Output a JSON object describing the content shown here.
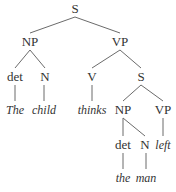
{
  "diagram": {
    "type": "syntax-tree",
    "nodes": [
      {
        "id": "s1",
        "label": "S",
        "kind": "category"
      },
      {
        "id": "np1",
        "label": "NP",
        "kind": "category"
      },
      {
        "id": "vp1",
        "label": "VP",
        "kind": "category"
      },
      {
        "id": "det1",
        "label": "det",
        "kind": "category"
      },
      {
        "id": "n1",
        "label": "N",
        "kind": "category"
      },
      {
        "id": "v1",
        "label": "V",
        "kind": "category"
      },
      {
        "id": "s2",
        "label": "S",
        "kind": "category"
      },
      {
        "id": "w_the1",
        "label": "The",
        "kind": "word"
      },
      {
        "id": "w_child",
        "label": "child",
        "kind": "word"
      },
      {
        "id": "w_thinks",
        "label": "thinks",
        "kind": "word"
      },
      {
        "id": "np2",
        "label": "NP",
        "kind": "category"
      },
      {
        "id": "vp2",
        "label": "VP",
        "kind": "category"
      },
      {
        "id": "det2",
        "label": "det",
        "kind": "category"
      },
      {
        "id": "n2",
        "label": "N",
        "kind": "category"
      },
      {
        "id": "w_left",
        "label": "left",
        "kind": "word"
      },
      {
        "id": "w_the2",
        "label": "the",
        "kind": "word"
      },
      {
        "id": "w_man",
        "label": "man",
        "kind": "word"
      }
    ],
    "edges": [
      [
        "s1",
        "np1"
      ],
      [
        "s1",
        "vp1"
      ],
      [
        "np1",
        "det1"
      ],
      [
        "np1",
        "n1"
      ],
      [
        "det1",
        "w_the1"
      ],
      [
        "n1",
        "w_child"
      ],
      [
        "vp1",
        "v1"
      ],
      [
        "vp1",
        "s2"
      ],
      [
        "v1",
        "w_thinks"
      ],
      [
        "s2",
        "np2"
      ],
      [
        "s2",
        "vp2"
      ],
      [
        "np2",
        "det2"
      ],
      [
        "np2",
        "n2"
      ],
      [
        "vp2",
        "w_left"
      ],
      [
        "det2",
        "w_the2"
      ],
      [
        "n2",
        "w_man"
      ]
    ]
  }
}
